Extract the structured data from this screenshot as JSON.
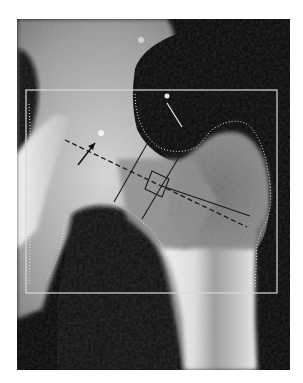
{
  "image": {
    "type": "dxa-hip-scan",
    "description": "Grayscale DXA bone densitometry scan of the proximal femur with region-of-interest overlays",
    "colors": {
      "background": "#000000",
      "page": "#ffffff",
      "roi_box": "#d8d8d8",
      "bone_bright": "#f2f2f2",
      "bone_mid": "#8a8a8a",
      "overlay_lines": "#1a1a1a"
    }
  },
  "overlays": {
    "roi_box": "analysis-region-rectangle",
    "bone_edge": "dotted-bone-contour",
    "neck_box_lines": "femoral-neck-roi",
    "axis_line": "femoral-neck-axis-dashed",
    "ward_box": "wards-triangle-square",
    "arrows": [
      "black-arrow-pointer",
      "white-arrow-pointer"
    ]
  }
}
